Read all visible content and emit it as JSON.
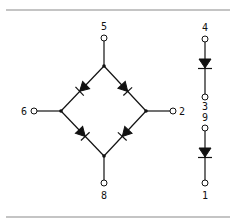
{
  "diagram": {
    "type": "diode bridge schematic with two separate diodes",
    "colors": {
      "line": "#111111",
      "rule": "#8a8a8a",
      "background": "#ffffff"
    },
    "bridge": {
      "terminals": [
        {
          "id": "5",
          "label": "5",
          "position": "top"
        },
        {
          "id": "2",
          "label": "2",
          "position": "right"
        },
        {
          "id": "8",
          "label": "8",
          "position": "bottom"
        },
        {
          "id": "6",
          "label": "6",
          "position": "left"
        }
      ],
      "diodes": [
        {
          "from": "top-node",
          "to": "left-node",
          "direction": "down-left"
        },
        {
          "from": "top-node",
          "to": "right-node",
          "direction": "down-right"
        },
        {
          "from": "left-node",
          "to": "bottom-node",
          "direction": "down-right"
        },
        {
          "from": "right-node",
          "to": "bottom-node",
          "direction": "down-left"
        }
      ]
    },
    "discrete_diodes": [
      {
        "anode_label": "4",
        "cathode_label": "3"
      },
      {
        "anode_label": "9",
        "cathode_label": "1"
      }
    ]
  }
}
